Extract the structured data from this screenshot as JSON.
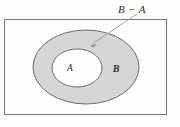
{
  "figure": {
    "type": "venn-diagram",
    "labels": {
      "difference": "B − A",
      "inner_set": "A",
      "outer_set": "B"
    },
    "colors": {
      "background": "#fdfdfc",
      "shaded_region": "#d8d6d4",
      "inner_region": "#fdfdfc",
      "stroke": "#6e6c6a",
      "rect_stroke": "#7a7876",
      "pointer_stroke": "#9a9896",
      "text": "#2b2b2b"
    },
    "geometry": {
      "rect": {
        "x": 4,
        "y": 19,
        "width": 163,
        "height": 96
      },
      "outer_ellipse": {
        "cx": 86,
        "cy": 67,
        "rx": 53,
        "ry": 37
      },
      "inner_ellipse": {
        "cx": 77,
        "cy": 68,
        "rx": 25,
        "ry": 19
      },
      "pointer": {
        "x1": 137,
        "y1": 14,
        "x2": 90,
        "y2": 45
      }
    },
    "label_positions": {
      "difference": {
        "x": 118,
        "y": 12
      },
      "inner_set": {
        "x": 70,
        "y": 71
      },
      "outer_set": {
        "x": 115,
        "y": 72
      }
    }
  }
}
